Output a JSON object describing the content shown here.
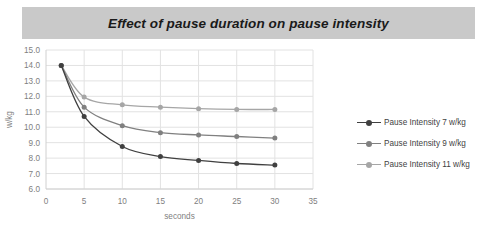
{
  "title": "Effect of pause duration on pause intensity",
  "colors": {
    "banner_bg": "#c9c9c9",
    "plot_bg": "#ffffff",
    "gridline": "#e2e2e2",
    "tick_text": "#808080",
    "series_1": "#404040",
    "series_2": "#808080",
    "series_3": "#a6a6a6"
  },
  "legend": {
    "position": "right",
    "items": [
      {
        "label": "Pause Intensity 7 w/kg",
        "color": "#404040"
      },
      {
        "label": "Pause Intensity 9 w/kg",
        "color": "#808080"
      },
      {
        "label": "Pause Intensity 11 w/kg",
        "color": "#a6a6a6"
      }
    ]
  },
  "axes": {
    "x_ticks": [
      "0",
      "5",
      "10",
      "15",
      "20",
      "25",
      "30",
      "35"
    ],
    "y_ticks": [
      "15.0",
      "14.0",
      "13.0",
      "12.0",
      "11.0",
      "10.0",
      "9.0",
      "8.0",
      "7.0",
      "6.0"
    ],
    "xlabel": "seconds",
    "ylabel": "w/kg"
  },
  "chart_data": {
    "type": "line",
    "title": "Effect of pause duration on pause intensity",
    "xlabel": "seconds",
    "ylabel": "w/kg",
    "xlim": [
      0,
      35
    ],
    "ylim": [
      6.0,
      15.0
    ],
    "xticks": [
      0,
      5,
      10,
      15,
      20,
      25,
      30,
      35
    ],
    "yticks": [
      6.0,
      7.0,
      8.0,
      9.0,
      10.0,
      11.0,
      12.0,
      13.0,
      14.0,
      15.0
    ],
    "grid": true,
    "legend_position": "right",
    "x": [
      2,
      5,
      10,
      15,
      20,
      25,
      30
    ],
    "series": [
      {
        "name": "Pause Intensity 7 w/kg",
        "color": "#404040",
        "values": [
          14.0,
          10.7,
          8.75,
          8.1,
          7.85,
          7.65,
          7.55
        ]
      },
      {
        "name": "Pause Intensity 9 w/kg",
        "color": "#808080",
        "values": [
          14.0,
          11.3,
          10.1,
          9.65,
          9.5,
          9.4,
          9.3
        ]
      },
      {
        "name": "Pause Intensity 11 w/kg",
        "color": "#a6a6a6",
        "values": [
          14.0,
          11.95,
          11.45,
          11.3,
          11.2,
          11.15,
          11.15
        ]
      }
    ]
  }
}
